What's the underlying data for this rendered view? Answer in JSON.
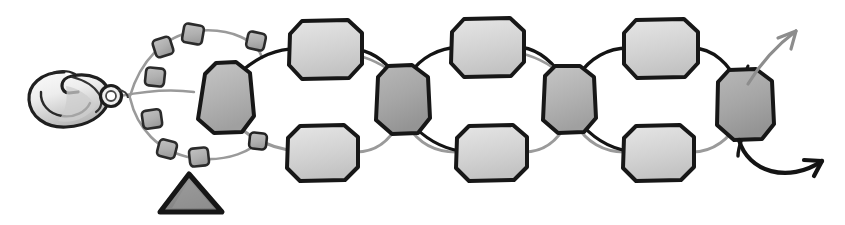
{
  "figure": {
    "title": "Beaded bracelet assembly illustration",
    "background_color": "#ffffff",
    "width": 845,
    "height": 225
  },
  "palette": {
    "outline_dark": "#1a1a1a",
    "outline_mid": "#4d4d4d",
    "bead_light": "#d4d4d4",
    "bead_light_edge": "#bdbdbd",
    "bead_mid": "#b4b4b4",
    "bead_dark": "#a6a6a6",
    "small_bead": "#b0b0b0",
    "thread_dark": "#141414",
    "thread_light": "#9a9a9a",
    "triangle_fill": "#8f8f8f",
    "clasp_fill": "#f2f2f2",
    "clasp_shade": "#c9c9c9"
  },
  "components": {
    "clasp": {
      "name": "lobster-clasp",
      "label": "Lobster claw clasp",
      "center_x": 72,
      "center_y": 98,
      "width": 78,
      "height": 55
    },
    "jump_ring": {
      "name": "jump-ring",
      "label": "Jump ring connector",
      "cx": 111,
      "cy": 96,
      "r": 10
    },
    "triangle_marker": {
      "name": "triangle-marker",
      "label": "Triangle marker",
      "points": "189,174 221,212 161,212",
      "fill": "#8f8f8f",
      "stroke": "#161616",
      "stroke_width": 5
    }
  },
  "threads": [
    {
      "name": "thread-upper-dark",
      "color": "#141414",
      "width": 3.2,
      "label": "Upper dark strand"
    },
    {
      "name": "thread-lower-light",
      "color": "#9a9a9a",
      "width": 3.0,
      "label": "Lower light strand"
    },
    {
      "name": "thread-loop-light",
      "color": "#9a9a9a",
      "width": 2.6,
      "label": "Clasp loop strand"
    }
  ],
  "loop_beads": {
    "label": "Small square beads around clasp loop",
    "count": 8,
    "fill": "#b0b0b0",
    "stroke": "#2b2b2b",
    "items": [
      {
        "cx": 163,
        "cy": 47,
        "size": 17,
        "rot": -18
      },
      {
        "cx": 192,
        "cy": 34,
        "size": 19,
        "rot": 10
      },
      {
        "cx": 255,
        "cy": 41,
        "size": 17,
        "rot": 12
      },
      {
        "cx": 155,
        "cy": 77,
        "size": 18,
        "rot": 6
      },
      {
        "cx": 152,
        "cy": 119,
        "size": 18,
        "rot": -8
      },
      {
        "cx": 166,
        "cy": 149,
        "size": 17,
        "rot": 14
      },
      {
        "cx": 198,
        "cy": 157,
        "size": 18,
        "rot": -6
      },
      {
        "cx": 256,
        "cy": 145,
        "size": 16,
        "rot": 8
      }
    ]
  },
  "main_beads": {
    "label": "Octagonal beads",
    "stroke": "#171717",
    "rows": [
      {
        "name": "row-upper",
        "label": "Upper bead row",
        "items": [
          {
            "cx": 325,
            "cy": 49,
            "w": 72,
            "h": 62,
            "fill": "#d8d8d8"
          },
          {
            "cx": 487,
            "cy": 47,
            "w": 72,
            "h": 62,
            "fill": "#d8d8d8"
          },
          {
            "cx": 660,
            "cy": 48,
            "w": 74,
            "h": 62,
            "fill": "#d8d8d8"
          }
        ]
      },
      {
        "name": "row-lower",
        "label": "Lower bead row",
        "items": [
          {
            "cx": 322,
            "cy": 152,
            "w": 72,
            "h": 60,
            "fill": "#d3d3d3"
          },
          {
            "cx": 491,
            "cy": 152,
            "w": 72,
            "h": 60,
            "fill": "#d3d3d3"
          },
          {
            "cx": 658,
            "cy": 152,
            "w": 72,
            "h": 60,
            "fill": "#d3d3d3"
          }
        ]
      },
      {
        "name": "row-connector",
        "label": "Vertical connector beads",
        "items": [
          {
            "cx": 224,
            "cy": 98,
            "w": 62,
            "h": 72,
            "fill": "#b6b6b6"
          },
          {
            "cx": 402,
            "cy": 99,
            "w": 58,
            "h": 70,
            "fill": "#ababab"
          },
          {
            "cx": 569,
            "cy": 99,
            "w": 56,
            "h": 68,
            "fill": "#b9b9b9"
          },
          {
            "cx": 745,
            "cy": 103,
            "w": 60,
            "h": 72,
            "fill": "#a8a8a8"
          }
        ]
      }
    ]
  },
  "arrows": [
    {
      "name": "arrow-upper-right",
      "label": "Upper continuation arrow",
      "color": "#8d8d8d",
      "width": 3.0,
      "path": "M 742 86 C 758 66, 775 48, 795 33",
      "head": "M 795 33 L 781 39 M 795 33 L 790 48"
    },
    {
      "name": "arrow-lower-right",
      "label": "Lower continuation arrow",
      "color": "#141414",
      "width": 4.0,
      "path": "M 739 135 C 752 168, 790 176, 823 160",
      "head": "M 823 160 L 807 158 M 823 160 L 814 173"
    }
  ],
  "spacer_beads": {
    "label": "Spacer beads on strands",
    "fill": "#b4b4b4",
    "stroke": "#232323",
    "items": [
      {
        "cx": 258,
        "cy": 140,
        "size": 16,
        "rot": 6
      }
    ]
  }
}
